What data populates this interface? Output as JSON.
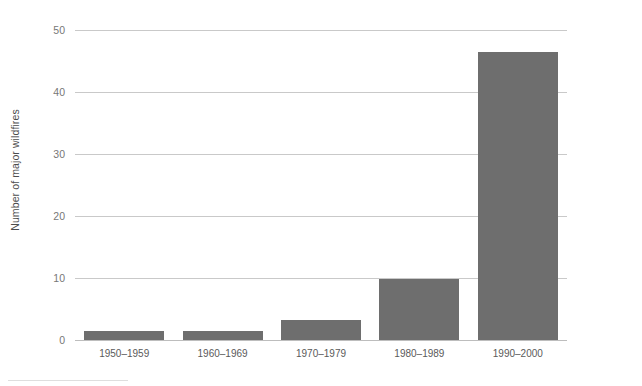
{
  "chart_data": {
    "type": "bar",
    "title": "",
    "subtitle": "",
    "xlabel": "",
    "ylabel": "Number of major wildfires",
    "categories": [
      "1950–1959",
      "1960–1969",
      "1970–1979",
      "1980–1989",
      "1990–2000"
    ],
    "values": [
      1.5,
      1.5,
      3.3,
      9.9,
      46.5
    ],
    "series": [
      {
        "name": "Number of major wildfires",
        "values": [
          1.5,
          1.5,
          3.3,
          9.9,
          46.5
        ]
      }
    ],
    "ylim": [
      0,
      50
    ],
    "yticks": [
      0,
      10,
      20,
      30,
      40,
      50
    ],
    "ytick_labels": [
      "0",
      "10",
      "20",
      "30",
      "40",
      "50"
    ],
    "xlim": [
      0,
      5
    ],
    "grid": "horizontal",
    "legend": "none",
    "bar_color": "#6e6e6e",
    "gridline_color": "#c9c9c9",
    "axis_text_color": "#777777",
    "label_text_color": "#5a5a5a",
    "background_color": "#ffffff",
    "annotations": []
  }
}
